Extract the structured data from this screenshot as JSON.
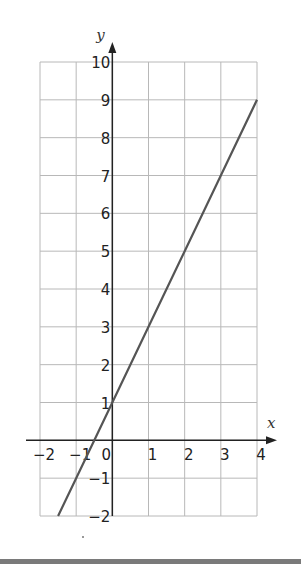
{
  "chart_data": {
    "type": "line",
    "title": "",
    "xlabel": "x",
    "ylabel": "y",
    "xlim": [
      -2,
      4
    ],
    "ylim": [
      -2,
      10
    ],
    "grid": true,
    "x_ticks": [
      "-2",
      "-1",
      "0",
      "1",
      "2",
      "3",
      "4"
    ],
    "y_ticks": [
      "-2",
      "-1",
      "1",
      "2",
      "3",
      "4",
      "5",
      "6",
      "7",
      "8",
      "9",
      "10"
    ],
    "series": [
      {
        "name": "y = 2x + 1",
        "x": [
          -1.5,
          -1,
          0,
          1,
          2,
          3,
          4
        ],
        "y": [
          -2,
          -1,
          1,
          3,
          5,
          7,
          9
        ]
      }
    ],
    "legend": null
  },
  "colors": {
    "grid": "#b8b8b8",
    "axis": "#222222",
    "line": "#555555",
    "bottom_bar": "#7a7a7a"
  }
}
